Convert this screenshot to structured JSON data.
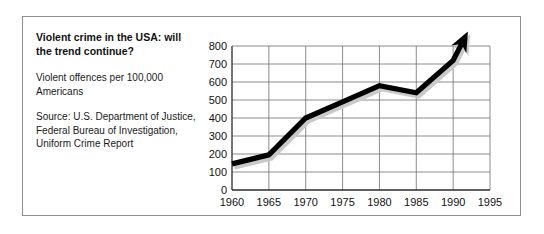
{
  "figure": {
    "caption": {
      "title": "Violent crime in the USA: will the trend continue?",
      "subject": "Violent offences per 100,000 Americans",
      "source": "Source: U.S. Department of Justice, Federal Bureau of Investigation, Uniform Crime Report"
    },
    "colors": {
      "line": "#000000",
      "shadow": "#c9c9c9",
      "grid": "#6e6e6e",
      "axis": "#2b2b2b",
      "frame": "#8e8e8e",
      "text": "#111111",
      "background": "#ffffff"
    }
  },
  "chart_data": {
    "type": "line",
    "title": "Violent crime in the USA: will the trend continue?",
    "subtitle": "Violent offences per 100,000 Americans",
    "xlabel": "",
    "ylabel": "",
    "x": [
      1960,
      1965,
      1970,
      1975,
      1980,
      1985,
      1990
    ],
    "values": [
      145,
      195,
      400,
      490,
      580,
      540,
      720
    ],
    "series": [
      {
        "name": "Violent offences per 100,000 Americans",
        "values": [
          145,
          195,
          400,
          490,
          580,
          540,
          720
        ]
      }
    ],
    "xtick_labels": [
      "1960",
      "1965",
      "1970",
      "1975",
      "1980",
      "1985",
      "1990",
      "1995"
    ],
    "xtick_values": [
      1960,
      1965,
      1970,
      1975,
      1980,
      1985,
      1990,
      1995
    ],
    "ytick_labels": [
      "0",
      "100",
      "200",
      "300",
      "400",
      "500",
      "600",
      "700",
      "800"
    ],
    "ytick_values": [
      0,
      100,
      200,
      300,
      400,
      500,
      600,
      700,
      800
    ],
    "xlim": [
      1960,
      1995
    ],
    "ylim": [
      0,
      800
    ],
    "grid": true,
    "legend": false,
    "annotations": [
      {
        "type": "arrow",
        "label": "upward trend arrow extending beyond 1990 past the top of the plot",
        "from_x": 1985,
        "from_y": 540,
        "to_x": 1992,
        "to_y": 880
      }
    ]
  }
}
